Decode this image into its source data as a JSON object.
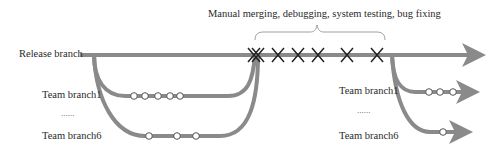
{
  "labels": {
    "release_branch": "Release branch",
    "annotation": "Manual merging, debugging, system testing, bug fixing",
    "left_team_branch1": "Team branch1",
    "left_ellipsis": "......",
    "left_team_branch6": "Team branch6",
    "right_team_branch1": "Team branch1",
    "right_ellipsis": "......",
    "right_team_branch6": "Team branch6"
  },
  "colors": {
    "line": "#8a8a8a",
    "marker": "#222222",
    "circle_fill": "#ffffff",
    "circle_stroke": "#555555"
  },
  "markers": {
    "x_marks_count": 7,
    "left_branch1_commits": 5,
    "left_branch6_commits": 3,
    "right_branch1_commits": 3,
    "right_branch6_commits": 1
  }
}
